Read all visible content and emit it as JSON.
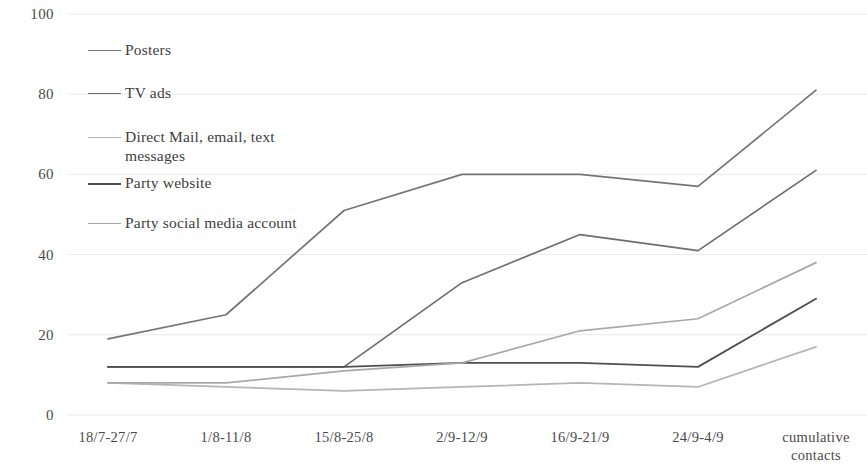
{
  "chart_data": {
    "type": "line",
    "title": "",
    "xlabel": "",
    "ylabel": "",
    "ylim": [
      0,
      100
    ],
    "yticks": [
      0,
      20,
      40,
      60,
      80,
      100
    ],
    "ytick_labels": [
      "0",
      "20",
      "40",
      "60",
      "80",
      "100"
    ],
    "grid": true,
    "legend_position": "upper-left-inside",
    "categories": [
      "18/7-27/7",
      "1/8-11/8",
      "15/8-25/8",
      "2/9-12/9",
      "16/9-21/9",
      "24/9-4/9",
      "cumulative contacts"
    ],
    "series": [
      {
        "name": "Posters",
        "color": "#757575",
        "values": [
          19,
          25,
          51,
          60,
          60,
          57,
          81
        ]
      },
      {
        "name": "TV ads",
        "color": "#6e6e6e",
        "values": [
          12,
          12,
          12,
          33,
          45,
          41,
          61
        ]
      },
      {
        "name": "Direct Mail, email, text messages",
        "color": "#b5b5b5",
        "values": [
          8,
          7,
          6,
          7,
          8,
          7,
          17
        ]
      },
      {
        "name": "Party website",
        "color": "#4f4f4f",
        "values": [
          12,
          12,
          12,
          13,
          13,
          12,
          29
        ]
      },
      {
        "name": "Party social media account",
        "color": "#a8a8a8",
        "values": [
          8,
          8,
          11,
          13,
          21,
          24,
          38
        ]
      }
    ]
  }
}
